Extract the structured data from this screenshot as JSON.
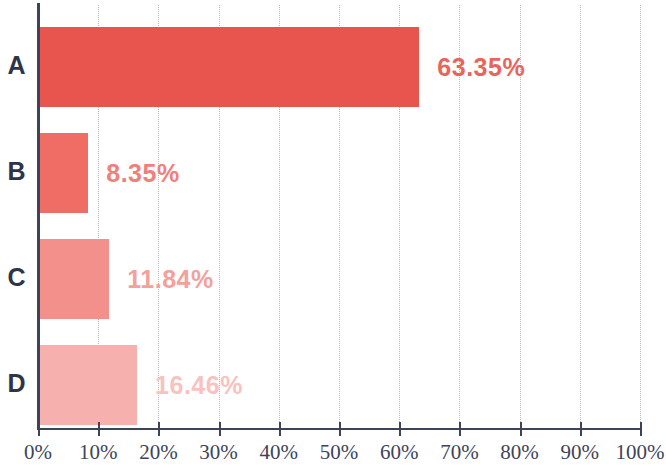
{
  "chart_data": {
    "type": "bar",
    "orientation": "horizontal",
    "title": "",
    "subtitle": "",
    "xlabel": "",
    "ylabel": "",
    "categories": [
      "A",
      "B",
      "C",
      "D"
    ],
    "values": [
      63.35,
      8.35,
      11.84,
      16.46
    ],
    "value_labels": [
      "63.35%",
      "8.35%",
      "11.84%",
      "16.46%"
    ],
    "bar_colors": [
      "#e8554e",
      "#ef6d64",
      "#f4908c",
      "#f6b0ad"
    ],
    "label_colors": [
      "#e8655e",
      "#f08079",
      "#f4a09b",
      "#f8c2bf"
    ],
    "xlim": [
      0,
      100
    ],
    "xticks": [
      0,
      10,
      20,
      30,
      40,
      50,
      60,
      70,
      80,
      90,
      100
    ],
    "xtick_labels": [
      "0%",
      "10%",
      "20%",
      "30%",
      "40%",
      "50%",
      "60%",
      "70%",
      "80%",
      "90%",
      "100%"
    ],
    "grid": true,
    "grid_style": "dotted",
    "grid_color": "#b9b9bd",
    "legend": false,
    "legend_position": "none",
    "axis_color": "#3e4458",
    "category_label_color": "#2f3548",
    "background_color": "#ffffff"
  }
}
